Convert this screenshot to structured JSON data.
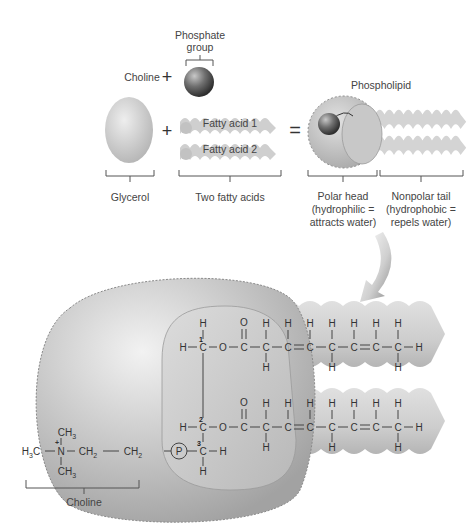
{
  "top_section": {
    "phosphate_label_line1": "Phosphate",
    "phosphate_label_line2": "group",
    "choline_label": "Choline",
    "plus1": "+",
    "plus2": "+",
    "equals": "=",
    "fatty_acid_1": "Fatty acid 1",
    "fatty_acid_2": "Fatty acid 2",
    "glycerol_label": "Glycerol",
    "two_fatty_acids_label": "Two fatty acids",
    "phospholipid_label": "Phospholipid",
    "polar_head_line1": "Polar head",
    "polar_head_line2": "(hydrophilic =",
    "polar_head_line3": "attracts water)",
    "nonpolar_tail_line1": "Nonpolar tail",
    "nonpolar_tail_line2": "(hydrophobic =",
    "nonpolar_tail_line3": "repels water)"
  },
  "structure": {
    "choline_bracket_label": "Choline",
    "carbon_numbers": [
      "1",
      "2",
      "3"
    ],
    "phosphate_symbol": "P",
    "atoms": {
      "H": "H",
      "C": "C",
      "O": "O",
      "N": "N",
      "CH3": "CH",
      "CH2": "CH",
      "H3C": "H",
      "sub2": "2",
      "sub3": "3",
      "plus": "+"
    }
  },
  "colors": {
    "blob": "#b5b5b5",
    "blob_light": "#e4e4e4",
    "inner_head": "#c9c9c9",
    "tail": "#c2c2c2",
    "tail_light": "#dedede",
    "sphere_dark": "#4a4a4a",
    "text": "#444444"
  }
}
